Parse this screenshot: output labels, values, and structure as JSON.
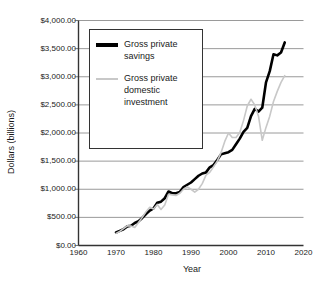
{
  "chart_data": {
    "type": "line",
    "title": "",
    "xlabel": "Year",
    "ylabel": "Dollars (billions)",
    "xlim": [
      1960,
      2020
    ],
    "ylim": [
      0,
      4000
    ],
    "grid": true,
    "legend_position": "top-left-inside",
    "x_ticks": [
      "1960",
      "1970",
      "1980",
      "1990",
      "2000",
      "2010",
      "2020"
    ],
    "y_ticks": [
      "$0.00",
      "$500.00",
      "$1,000.00",
      "$1,500.00",
      "$2,000.00",
      "$2,500.00",
      "$3,000.00",
      "$3,500.00",
      "$4,000.00"
    ],
    "x_tick_values": [
      1960,
      1970,
      1980,
      1990,
      2000,
      2010,
      2020
    ],
    "y_tick_values": [
      0,
      500,
      1000,
      1500,
      2000,
      2500,
      3000,
      3500,
      4000
    ],
    "series": [
      {
        "name": "Gross private savings",
        "color": "#000000",
        "width": 2.6,
        "x": [
          1970,
          1971,
          1972,
          1973,
          1974,
          1975,
          1976,
          1977,
          1978,
          1979,
          1980,
          1981,
          1982,
          1983,
          1984,
          1985,
          1986,
          1987,
          1988,
          1989,
          1990,
          1991,
          1992,
          1993,
          1994,
          1995,
          1996,
          1997,
          1998,
          1999,
          2000,
          2001,
          2002,
          2003,
          2004,
          2005,
          2006,
          2007,
          2008,
          2009,
          2010,
          2011,
          2012,
          2013,
          2014,
          2015
        ],
        "y": [
          230,
          260,
          290,
          340,
          350,
          400,
          430,
          490,
          560,
          620,
          660,
          760,
          780,
          840,
          960,
          930,
          930,
          950,
          1040,
          1080,
          1120,
          1180,
          1240,
          1280,
          1300,
          1390,
          1430,
          1520,
          1620,
          1640,
          1660,
          1700,
          1800,
          1900,
          2020,
          2090,
          2300,
          2430,
          2380,
          2450,
          2900,
          3100,
          3400,
          3380,
          3430,
          3610
        ]
      },
      {
        "name": "Gross private domestic investment",
        "color": "#c8c8c8",
        "width": 1.6,
        "x": [
          1970,
          1971,
          1972,
          1973,
          1974,
          1975,
          1976,
          1977,
          1978,
          1979,
          1980,
          1981,
          1982,
          1983,
          1984,
          1985,
          1986,
          1987,
          1988,
          1989,
          1990,
          1991,
          1992,
          1993,
          1994,
          1995,
          1996,
          1997,
          1998,
          1999,
          2000,
          2001,
          2002,
          2003,
          2004,
          2005,
          2006,
          2007,
          2008,
          2009,
          2010,
          2011,
          2012,
          2013,
          2014,
          2015
        ],
        "y": [
          215,
          250,
          300,
          350,
          345,
          320,
          410,
          500,
          600,
          680,
          650,
          730,
          640,
          720,
          910,
          900,
          890,
          930,
          1000,
          1040,
          1000,
          950,
          1000,
          1100,
          1250,
          1300,
          1400,
          1500,
          1650,
          1850,
          2000,
          1920,
          1920,
          2010,
          2220,
          2480,
          2600,
          2500,
          2300,
          1870,
          2100,
          2300,
          2560,
          2740,
          2900,
          3020
        ]
      }
    ]
  },
  "legend": {
    "entries": [
      {
        "label": "Gross private savings",
        "swatch": "savings"
      },
      {
        "label": "Gross private domestic investment",
        "swatch": "investment"
      }
    ]
  }
}
